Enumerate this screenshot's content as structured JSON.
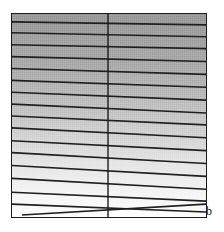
{
  "figure": {
    "label": "b",
    "panel": {
      "x": 11,
      "y": 13,
      "width": 196,
      "height": 205,
      "border_color": "#1b1b1b",
      "border_width": 1.5
    },
    "gradient": {
      "direction": "vertical",
      "top_color": "#a3a3a3",
      "mid_color": "#cfcfcf",
      "bottom_color": "#fdfdfd",
      "stops": [
        {
          "offset": 0.0,
          "color": "#a3a3a3"
        },
        {
          "offset": 0.25,
          "color": "#b4b4b4"
        },
        {
          "offset": 0.5,
          "color": "#cdcdcd"
        },
        {
          "offset": 0.72,
          "color": "#e6e6e6"
        },
        {
          "offset": 0.88,
          "color": "#f6f6f6"
        },
        {
          "offset": 1.0,
          "color": "#fdfdfd"
        }
      ]
    },
    "divider": {
      "orientation": "vertical",
      "x": 97,
      "color": "#1b1b1b",
      "width": 1.4
    },
    "hatch_lines": {
      "color": "#1f1f1f",
      "width": 1.6,
      "count": 17
    }
  },
  "chart_data": {
    "type": "area",
    "title": "",
    "subtitle": "",
    "xlabel": "",
    "ylabel": "",
    "annotations": [
      {
        "text": "b",
        "position": "bottom-right-outside"
      }
    ],
    "legend": [],
    "grid": false,
    "panel_label": "b",
    "xlim": [
      0,
      196
    ],
    "ylim": [
      0,
      205
    ],
    "series": [
      {
        "name": "hatch-lines",
        "kind": "line-set",
        "points": [
          {
            "index": 1,
            "x1": 0,
            "y1": 8,
            "x2": 196,
            "y2": 11
          },
          {
            "index": 2,
            "x1": 0,
            "y1": 19,
            "x2": 196,
            "y2": 23
          },
          {
            "index": 3,
            "x1": 0,
            "y1": 31,
            "x2": 196,
            "y2": 35
          },
          {
            "index": 4,
            "x1": 0,
            "y1": 43,
            "x2": 196,
            "y2": 48
          },
          {
            "index": 5,
            "x1": 0,
            "y1": 55,
            "x2": 196,
            "y2": 61
          },
          {
            "index": 6,
            "x1": 0,
            "y1": 67,
            "x2": 196,
            "y2": 74
          },
          {
            "index": 7,
            "x1": 0,
            "y1": 79,
            "x2": 196,
            "y2": 87
          },
          {
            "index": 8,
            "x1": 0,
            "y1": 91,
            "x2": 196,
            "y2": 100
          },
          {
            "index": 9,
            "x1": 0,
            "y1": 103,
            "x2": 196,
            "y2": 112
          },
          {
            "index": 10,
            "x1": 0,
            "y1": 115,
            "x2": 196,
            "y2": 125
          },
          {
            "index": 11,
            "x1": 0,
            "y1": 128,
            "x2": 196,
            "y2": 138
          },
          {
            "index": 12,
            "x1": 0,
            "y1": 140,
            "x2": 196,
            "y2": 151
          },
          {
            "index": 13,
            "x1": 0,
            "y1": 153,
            "x2": 196,
            "y2": 164
          },
          {
            "index": 14,
            "x1": 0,
            "y1": 166,
            "x2": 196,
            "y2": 177
          },
          {
            "index": 15,
            "x1": 0,
            "y1": 180,
            "x2": 196,
            "y2": 189
          },
          {
            "index": 16,
            "x1": 0,
            "y1": 192,
            "x2": 196,
            "y2": 200
          },
          {
            "index": 17,
            "x1": 10,
            "y1": 203,
            "x2": 196,
            "y2": 192
          }
        ]
      },
      {
        "name": "divider",
        "kind": "line-set",
        "points": [
          {
            "index": 1,
            "x1": 97,
            "y1": 0,
            "x2": 97,
            "y2": 205
          }
        ]
      }
    ]
  }
}
